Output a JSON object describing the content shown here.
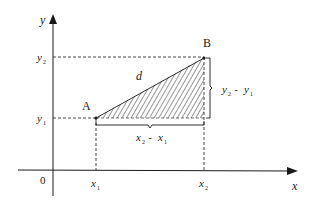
{
  "diagram": {
    "axes": {
      "x_label": "x",
      "y_label": "y",
      "origin_label": "0"
    },
    "points": {
      "A": {
        "label": "A",
        "x_var": "x",
        "x_sub": "1",
        "y_var": "y",
        "y_sub": "1"
      },
      "B": {
        "label": "B",
        "x_var": "x",
        "x_sub": "2",
        "y_var": "y",
        "y_sub": "2"
      }
    },
    "hypotenuse_label": "d",
    "horizontal_difference": {
      "a": "x",
      "a_sub": "2",
      "op": " - ",
      "b": "x",
      "b_sub": "1"
    },
    "vertical_difference": {
      "a": "y",
      "a_sub": "2",
      "op": " - ",
      "b": "y",
      "b_sub": "1"
    },
    "colors": {
      "line": "#1a1a1a",
      "background": "#ffffff"
    }
  }
}
